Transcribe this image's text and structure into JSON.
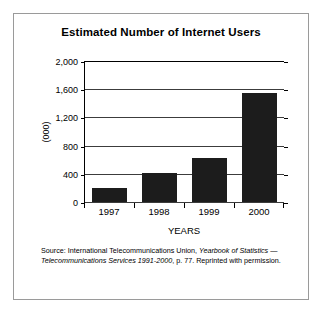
{
  "figure": {
    "title": "Estimated Number of Internet Users",
    "source_prefix": "Source: International Telecommunications Union, ",
    "source_italic_1": "Yearbook of Statistics — Telecommunications Services 1991-2000",
    "source_suffix": ", p. 77. Reprinted with permission."
  },
  "chart_data": {
    "type": "bar",
    "title": "Estimated Number of Internet Users",
    "categories": [
      "1997",
      "1998",
      "1999",
      "2000"
    ],
    "values": [
      200,
      410,
      620,
      1550
    ],
    "xlabel": "YEARS",
    "ylabel": "(000)",
    "ylim": [
      0,
      2000
    ],
    "yticks": [
      0,
      400,
      800,
      1200,
      1600,
      2000
    ],
    "ytick_labels": [
      "0",
      "400",
      "800",
      "1,200",
      "1,600",
      "2,000"
    ],
    "grid": true,
    "legend": null,
    "bar_color": "#1c1c1c",
    "units": "thousands"
  }
}
